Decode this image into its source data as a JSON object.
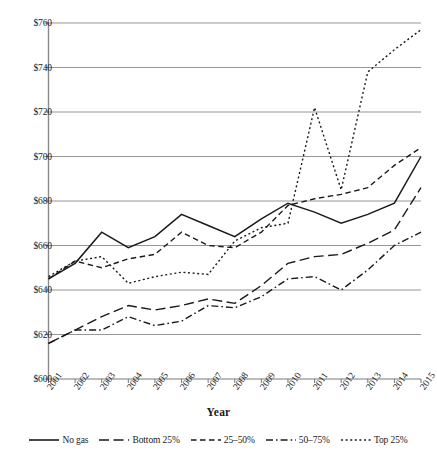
{
  "chart_data": {
    "type": "line",
    "title": "",
    "xlabel": "Year",
    "ylabel": "",
    "xlim": [
      2001,
      2015
    ],
    "ylim": [
      600,
      760
    ],
    "grid": true,
    "legend_position": "bottom",
    "y_tick_labels": [
      "$760",
      "$740",
      "$720",
      "$700",
      "$680",
      "$660",
      "$640",
      "$620",
      "$600"
    ],
    "y_tick_values": [
      760,
      740,
      720,
      700,
      680,
      660,
      640,
      620,
      600
    ],
    "x": [
      2001,
      2002,
      2003,
      2004,
      2005,
      2006,
      2007,
      2008,
      2009,
      2010,
      2011,
      2012,
      2013,
      2014,
      2015
    ],
    "categories": [
      "2001",
      "2002",
      "2003",
      "2004",
      "2005",
      "2006",
      "2007",
      "2008",
      "2009",
      "2010",
      "2011",
      "2012",
      "2013",
      "2014",
      "2015"
    ],
    "series": [
      {
        "name": "No gas",
        "style": "solid",
        "color": "#1a1a1a",
        "values": [
          645,
          652,
          666,
          659,
          664,
          674,
          669,
          664,
          672,
          679,
          675,
          670,
          674,
          679,
          700
        ]
      },
      {
        "name": "Bottom 25%",
        "style": "long-dash",
        "color": "#1a1a1a",
        "values": [
          616,
          622,
          628,
          633,
          631,
          633,
          636,
          634,
          642,
          652,
          655,
          656,
          661,
          667,
          686
        ]
      },
      {
        "name": "25-50%",
        "style": "dash",
        "color": "#1a1a1a",
        "values": [
          645,
          653,
          650,
          654,
          656,
          666,
          660,
          659,
          666,
          678,
          681,
          683,
          686,
          696,
          704
        ]
      },
      {
        "name": "50-75%",
        "style": "dash-dot",
        "color": "#1a1a1a",
        "values": [
          616,
          622,
          622,
          628,
          624,
          626,
          633,
          632,
          637,
          645,
          646,
          640,
          649,
          660,
          666
        ]
      },
      {
        "name": "Top 25%",
        "style": "dotted",
        "color": "#1a1a1a",
        "values": [
          646,
          653,
          655,
          643,
          646,
          648,
          647,
          662,
          668,
          670,
          722,
          685,
          738,
          748,
          757
        ]
      }
    ]
  },
  "axis": {
    "x_title": "Year"
  },
  "legend": {
    "items": [
      {
        "label": "No gas",
        "style": "solid"
      },
      {
        "label": "Bottom 25%",
        "style": "long-dash"
      },
      {
        "label": "25–50%",
        "style": "dash"
      },
      {
        "label": "50–75%",
        "style": "dash-dot"
      },
      {
        "label": "Top 25%",
        "style": "dotted"
      }
    ]
  }
}
